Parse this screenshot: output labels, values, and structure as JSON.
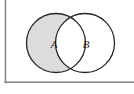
{
  "figure": {
    "type": "venn-diagram",
    "title": "",
    "background_color": "#ffffff",
    "frame": {
      "name": "universal-set-box",
      "stroke_color": "#808080",
      "stroke_width": 1.5,
      "left_border_visible": true,
      "bottom_border_visible": true,
      "top_border_visible": false,
      "right_border_visible": false,
      "left_x": 5,
      "bottom_y": 82,
      "right_x": 134,
      "top_y": 0
    },
    "sets": [
      {
        "name": "set-a",
        "label": "A",
        "label_x": 54,
        "label_y": 48,
        "cx": 56,
        "cy": 43,
        "r": 29.5,
        "stroke_color": "#262626",
        "stroke_width": 1.3,
        "fill_color": "#dcdcdc",
        "shaded": true,
        "shaded_region": "A-minus-B"
      },
      {
        "name": "set-b",
        "label": "B",
        "label_x": 86,
        "label_y": 48,
        "cx": 85,
        "cy": 43,
        "r": 29.5,
        "stroke_color": "#262626",
        "stroke_width": 1.3,
        "fill_color": "#ffffff",
        "shaded": false,
        "shaded_region": "none"
      }
    ],
    "intersection": {
      "name": "a-intersect-b",
      "fill_color": "#ffffff",
      "shaded": false
    }
  }
}
